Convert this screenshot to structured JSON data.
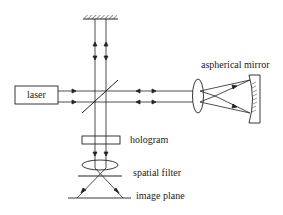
{
  "diagram": {
    "type": "optical-setup",
    "components": {
      "laser": "laser",
      "aspherical_mirror": "aspherical mirror",
      "hologram": "hologram",
      "spatial_filter": "spatial filter",
      "image_plane": "image plane"
    }
  },
  "colors": {
    "stroke": "#222222",
    "background": "#ffffff"
  }
}
